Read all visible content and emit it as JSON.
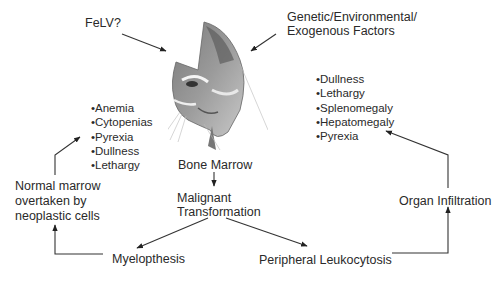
{
  "diagram": {
    "inputs": {
      "felv": "FeLV?",
      "factors_line1": "Genetic/Environmental/",
      "factors_line2": "Exogenous Factors"
    },
    "nodes": {
      "bone_marrow": "Bone Marrow",
      "malignant_line1": "Malignant",
      "malignant_line2": "Transformation",
      "myelopthesis": "Myelopthesis",
      "peripheral_leukocytosis": "Peripheral Leukocytosis",
      "organ_infiltration": "Organ Infiltration",
      "normal_marrow_line1": "Normal marrow",
      "normal_marrow_line2": "overtaken by",
      "normal_marrow_line3": "neoplastic cells"
    },
    "left_signs": [
      "Anemia",
      "Cytopenias",
      "Pyrexia",
      "Dullness",
      "Lethargy"
    ],
    "right_signs": [
      "Dullness",
      "Lethargy",
      "Splenomegaly",
      "Hepatomegaly",
      "Pyrexia"
    ],
    "center_image": "cat-head-sketch",
    "colors": {
      "line": "#333333",
      "text": "#2a2a2a",
      "background": "#ffffff"
    }
  }
}
